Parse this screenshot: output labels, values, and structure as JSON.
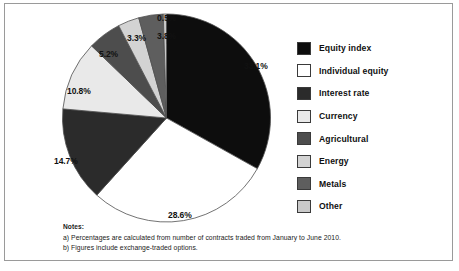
{
  "chart_data": {
    "type": "pie",
    "title": "",
    "categories": [
      "Equity index",
      "Individual equity",
      "Interest rate",
      "Currency",
      "Agricultural",
      "Energy",
      "Metals",
      "Other"
    ],
    "values": [
      33.1,
      28.6,
      14.7,
      10.8,
      5.2,
      3.3,
      3.8,
      0.5
    ],
    "value_labels": [
      "33.1%",
      "28.6%",
      "14.7%",
      "10.8%",
      "5.2%",
      "3.3%",
      "3.8%",
      "0.5%"
    ],
    "unit": "percent",
    "start_angle_deg": 0,
    "direction": "clockwise",
    "legend_position": "right",
    "grid": false,
    "slice_colors": [
      "#0d0d0d",
      "#ffffff",
      "#2b2b2b",
      "#e9e9e9",
      "#4d4d4d",
      "#d3d3d3",
      "#5e5e5e",
      "#c9c9c9"
    ],
    "annotations": [
      "0.5% slice has a vertical leader line to its label"
    ]
  },
  "legend": {
    "items": [
      {
        "label": "Equity index",
        "color": "#0d0d0d"
      },
      {
        "label": "Individual equity",
        "color": "#ffffff"
      },
      {
        "label": "Interest rate",
        "color": "#2b2b2b"
      },
      {
        "label": "Currency",
        "color": "#e9e9e9"
      },
      {
        "label": "Agricultural",
        "color": "#4d4d4d"
      },
      {
        "label": "Energy",
        "color": "#d3d3d3"
      },
      {
        "label": "Metals",
        "color": "#5e5e5e"
      },
      {
        "label": "Other",
        "color": "#c9c9c9"
      }
    ]
  },
  "labels": {
    "equity_index": "33.1%",
    "individual_equity": "28.6%",
    "interest_rate": "14.7%",
    "currency": "10.8%",
    "agricultural": "5.2%",
    "energy": "3.3%",
    "metals": "3.8%",
    "other": "0.5%"
  },
  "notes": {
    "heading": "Notes:",
    "line_a": "a) Percentages are calculated from number of contracts traded from January to June 2010.",
    "line_b": "b) Figures include exchange-traded options."
  }
}
